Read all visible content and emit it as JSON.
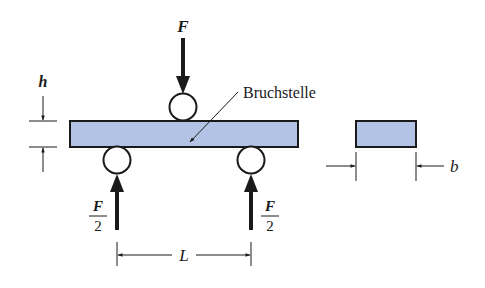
{
  "figure": {
    "type": "three-point bending test",
    "colors": {
      "beam_fill": "#b3c3e6",
      "stroke": "#1a1a1a",
      "background": "#ffffff"
    }
  },
  "labels": {
    "force_top": "F",
    "fracture_point": "Bruchstelle",
    "height": "h",
    "width": "b",
    "span": "L",
    "support_left_num": "F",
    "support_left_den": "2",
    "support_right_num": "F",
    "support_right_den": "2"
  },
  "elements": {
    "beam": {
      "label": "specimen beam"
    },
    "cross_section": {
      "label": "cross-section"
    },
    "rollers": [
      "load roller",
      "left support roller",
      "right support roller"
    ]
  }
}
